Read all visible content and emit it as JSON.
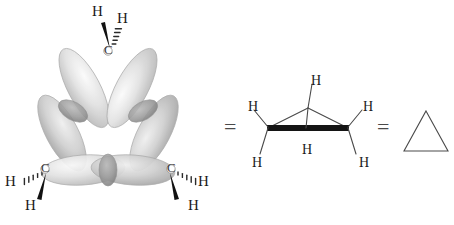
{
  "figure": {
    "background_color": "#ffffff",
    "width": 454,
    "height": 225
  },
  "equals_signs": [
    {
      "symbol": "=",
      "x": 224,
      "y": 119,
      "size": 22
    },
    {
      "symbol": "=",
      "x": 377,
      "y": 119,
      "size": 22
    }
  ],
  "orbital_model": {
    "name": "orbital-overlap-model",
    "description": "Bent banana bonds of cyclopropane shown as overlapping sp3 orbital lobes",
    "lobe_fill_light": "#f2f2f2",
    "lobe_fill_mid": "#c8c8c8",
    "lobe_stroke": "#9a9a9a",
    "overlap_fill": "#8f8f8f",
    "carbons": [
      {
        "label": "C",
        "x": 108,
        "y": 50,
        "position": "top"
      },
      {
        "label": "C",
        "x": 44,
        "y": 168,
        "position": "bottom-left"
      },
      {
        "label": "C",
        "x": 172,
        "y": 168,
        "position": "bottom-right"
      }
    ],
    "hydrogens": [
      {
        "label": "H",
        "x": 97,
        "y": 13,
        "bond": "wedge",
        "attached_to": "top"
      },
      {
        "label": "H",
        "x": 121,
        "y": 18,
        "bond": "hash",
        "attached_to": "top"
      },
      {
        "label": "H",
        "x": 8,
        "y": 182,
        "bond": "hash",
        "attached_to": "bottom-left"
      },
      {
        "label": "H",
        "x": 28,
        "y": 207,
        "bond": "wedge",
        "attached_to": "bottom-left"
      },
      {
        "label": "H",
        "x": 205,
        "y": 182,
        "bond": "hash",
        "attached_to": "bottom-right"
      },
      {
        "label": "H",
        "x": 194,
        "y": 207,
        "bond": "wedge",
        "attached_to": "bottom-right"
      }
    ]
  },
  "line_structure": {
    "name": "perspective-line-structure",
    "description": "Cyclopropane drawn in perspective with bold front bond and six C-H bonds",
    "bond_color": "#4a4a4a",
    "bold_bond_color": "#1a1a1a",
    "hydrogens": [
      {
        "label": "H",
        "x": 316,
        "y": 82,
        "position": "apex-up"
      },
      {
        "label": "H",
        "x": 258,
        "y": 108,
        "position": "left-up"
      },
      {
        "label": "H",
        "x": 355,
        "y": 108,
        "position": "right-up"
      },
      {
        "label": "H",
        "x": 258,
        "y": 164,
        "position": "left-down"
      },
      {
        "label": "H",
        "x": 316,
        "y": 152,
        "position": "apex-down"
      },
      {
        "label": "H",
        "x": 355,
        "y": 164,
        "position": "right-down"
      }
    ]
  },
  "skeletal_structure": {
    "name": "skeletal-triangle",
    "description": "Skeletal triangle shorthand for cyclopropane",
    "stroke_color": "#4a4a4a",
    "x": 404,
    "y": 110,
    "width": 44,
    "height": 42
  }
}
